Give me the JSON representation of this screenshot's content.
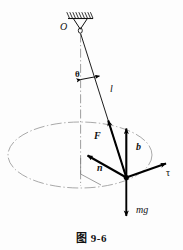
{
  "figure": {
    "caption": "图 9-6",
    "colors": {
      "ink": "#111111",
      "vector": "#000000",
      "chain_line": "#8a8a8a",
      "background": "#fdfdfd"
    },
    "labels": {
      "pivot": "O",
      "angle": "θ",
      "string_length": "l",
      "tension": "F",
      "binormal": "b",
      "normal": "n",
      "tangent": "τ",
      "weight": "mg"
    },
    "elements": {
      "ceiling": "hatched-ceiling",
      "hook": "pivot-hook",
      "axis": "vertical-dash-dot-axis",
      "path": "circular-path-ellipse",
      "string": "pendulum-string",
      "bob": "pendulum-bob"
    }
  }
}
